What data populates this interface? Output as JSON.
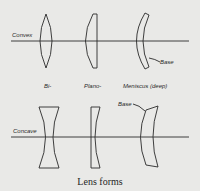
{
  "diagram": {
    "caption": "Lens forms",
    "rows": [
      {
        "label": "Convex"
      },
      {
        "label": "Concave"
      }
    ],
    "columns": [
      {
        "label": "Bi-"
      },
      {
        "label": "Plano-"
      },
      {
        "label": "Meniscus (deep)"
      }
    ],
    "annotations": {
      "base_convex": "Base",
      "base_concave": "Base"
    },
    "colors": {
      "background": "#e9e9e7",
      "ink": "#2a2a2a"
    }
  }
}
